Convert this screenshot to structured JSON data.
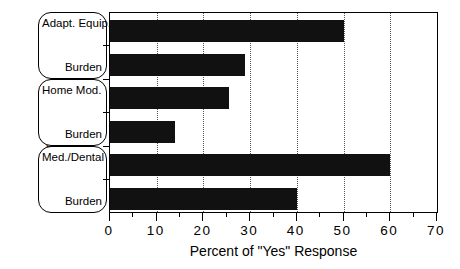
{
  "chart_data": {
    "type": "bar",
    "orientation": "horizontal",
    "title": "",
    "xlabel": "Percent of \"Yes\" Response",
    "ylabel": "Family Expenses",
    "xlim": [
      0,
      70
    ],
    "ylim": [
      0,
      6
    ],
    "grid": true,
    "legend": false,
    "xticks": [
      0,
      10,
      20,
      30,
      40,
      50,
      60,
      70
    ],
    "xtick_labels": [
      "0",
      "10",
      "20",
      "30",
      "40",
      "50",
      "60",
      "70"
    ],
    "minor_xticks": [
      5,
      15,
      25,
      35,
      45,
      55,
      65
    ],
    "bar_color": "#111111",
    "categories": [
      "Adapt. Equip.",
      "Burden",
      "Home Mod.",
      "Burden",
      "Med./Dental",
      "Burden"
    ],
    "values": [
      50,
      29,
      25.5,
      14,
      60,
      40
    ],
    "groups": [
      {
        "label": "Adapt. Equip.",
        "sublabel": "Burden",
        "values": [
          50,
          29
        ]
      },
      {
        "label": "Home Mod.",
        "sublabel": "Burden",
        "values": [
          25.5,
          14
        ]
      },
      {
        "label": "Med./Dental",
        "sublabel": "Burden",
        "values": [
          60,
          40
        ]
      }
    ]
  },
  "axes": {
    "y_title": "Family Expenses",
    "x_title": "Percent of \"Yes\" Response"
  },
  "tick_labels": {
    "t0": "0",
    "t1": "10",
    "t2": "20",
    "t3": "30",
    "t4": "40",
    "t5": "50",
    "t6": "60",
    "t7": "70"
  },
  "group_labels": {
    "g0_top": "Adapt. Equip.",
    "g0_bottom": "Burden",
    "g1_top": "Home Mod.",
    "g1_bottom": "Burden",
    "g2_top": "Med./Dental",
    "g2_bottom": "Burden"
  }
}
